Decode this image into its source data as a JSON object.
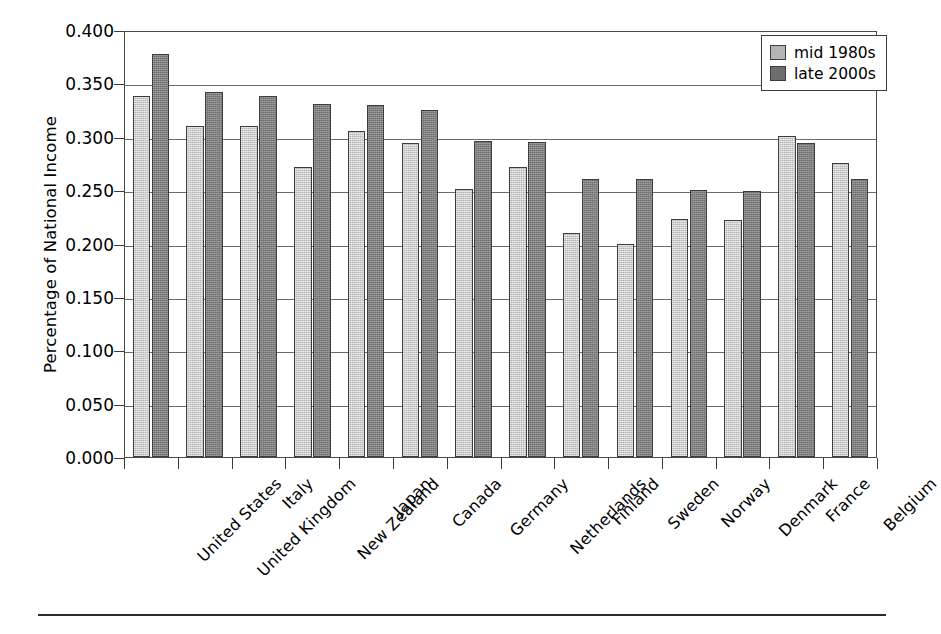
{
  "chart_data": {
    "type": "bar",
    "title": "",
    "xlabel": "",
    "ylabel": "Percentage of National Income",
    "ylim": [
      0.0,
      0.4
    ],
    "ytick_labels": [
      "0.000",
      "0.050",
      "0.100",
      "0.150",
      "0.200",
      "0.250",
      "0.300",
      "0.350",
      "0.400"
    ],
    "ytick_values": [
      0.0,
      0.05,
      0.1,
      0.15,
      0.2,
      0.25,
      0.3,
      0.35,
      0.4
    ],
    "grid": true,
    "legend_position": "top-right",
    "categories": [
      "United States",
      "United Kingdom",
      "Italy",
      "New Zealand",
      "Japan",
      "Canada",
      "Germany",
      "Netherlands",
      "Finland",
      "Sweden",
      "Norway",
      "Denmark",
      "France",
      "Belgium"
    ],
    "series": [
      {
        "name": "mid 1980s",
        "color": "#b4b4b4",
        "values": [
          0.338,
          0.31,
          0.31,
          0.272,
          0.305,
          0.294,
          0.251,
          0.272,
          0.21,
          0.2,
          0.223,
          0.222,
          0.301,
          0.275
        ]
      },
      {
        "name": "late 2000s",
        "color": "#6d6d6d",
        "values": [
          0.378,
          0.342,
          0.338,
          0.331,
          0.33,
          0.325,
          0.296,
          0.295,
          0.26,
          0.26,
          0.25,
          0.249,
          0.294,
          0.26
        ]
      }
    ]
  },
  "legend": {
    "items": [
      {
        "label": "mid 1980s",
        "swatch": "light-gray-swatch"
      },
      {
        "label": "late 2000s",
        "swatch": "dark-gray-swatch"
      }
    ]
  }
}
